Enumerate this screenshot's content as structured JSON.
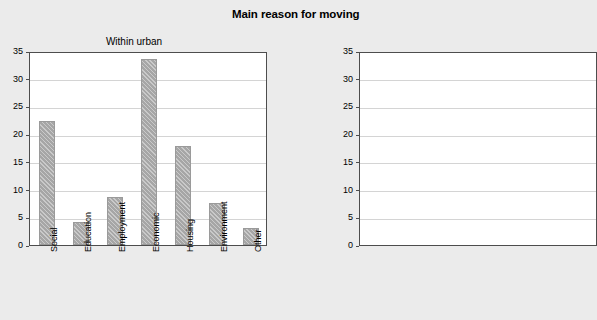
{
  "figure": {
    "title": "Main reason for moving",
    "background_color": "#ebebeb"
  },
  "chart_data": [
    {
      "type": "bar",
      "title": "Within urban",
      "xlabel": "",
      "ylabel": "",
      "ylim": [
        0,
        35
      ],
      "yticks": [
        0,
        5,
        10,
        15,
        20,
        25,
        30,
        35
      ],
      "grid": true,
      "legend": "none",
      "bar_color": "#a6a6a6",
      "categories": [
        "Social",
        "Education",
        "Employment",
        "Economic",
        "Housing",
        "Environment",
        "Other"
      ],
      "values": [
        22.3,
        4.2,
        8.7,
        33.6,
        17.8,
        7.5,
        3.0
      ]
    },
    {
      "type": "bar",
      "title": "",
      "note": "second panel cropped at right edge of screenshot; only y-axis visible",
      "ylim": [
        0,
        35
      ],
      "yticks": [
        0,
        5,
        10,
        15,
        20,
        25,
        30,
        35
      ],
      "grid": true,
      "categories": [],
      "values": []
    }
  ]
}
